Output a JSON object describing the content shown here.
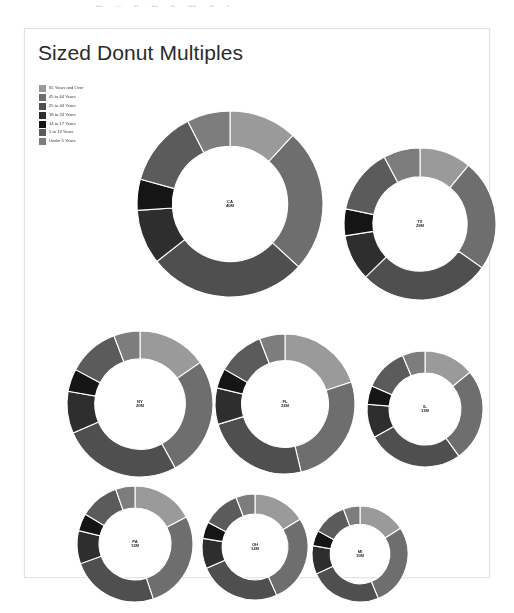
{
  "top_bar": {
    "fragments": [
      "•••",
      "—",
      "••",
      "•••",
      "••",
      "••••",
      "••",
      "•"
    ]
  },
  "panel": {
    "title": "Sized Donut Multiples"
  },
  "legend": {
    "entries": [
      {
        "label": "65 Years and Over",
        "color": "#9a9a9a"
      },
      {
        "label": "45 to 64 Years",
        "color": "#6e6e6e"
      },
      {
        "label": "25 to 44 Years",
        "color": "#4f4f4f"
      },
      {
        "label": "18 to 24 Years",
        "color": "#2e2e2e"
      },
      {
        "label": "14 to 17 Years",
        "color": "#151515"
      },
      {
        "label": "5 to 13 Years",
        "color": "#5b5b5b"
      },
      {
        "label": "Under 5 Years",
        "color": "#7d7d7d"
      }
    ]
  },
  "chart_data": {
    "type": "pie",
    "title": "Sized Donut Multiples",
    "subtype": "donut-multiples",
    "legend_position": "top-left",
    "size_encodes": "total population",
    "categories": [
      "65 Years and Over",
      "45 to 64 Years",
      "25 to 44 Years",
      "18 to 24 Years",
      "14 to 17 Years",
      "5 to 13 Years",
      "Under 5 Years"
    ],
    "colors": [
      "#9a9a9a",
      "#6e6e6e",
      "#4f4f4f",
      "#2e2e2e",
      "#151515",
      "#5b5b5b",
      "#7d7d7d"
    ],
    "donuts": [
      {
        "state": "CA",
        "value": "40M",
        "total": 40,
        "radius": 93,
        "inner_ratio": 0.62,
        "cx": 205,
        "cy": 175,
        "values": [
          11.8,
          25.0,
          27.6,
          9.5,
          5.4,
          13.2,
          7.5
        ]
      },
      {
        "state": "TX",
        "value": "29M",
        "total": 29,
        "radius": 76,
        "inner_ratio": 0.62,
        "cx": 395,
        "cy": 195,
        "values": [
          11.0,
          23.8,
          27.9,
          9.8,
          5.7,
          14.0,
          7.8
        ]
      },
      {
        "state": "NY",
        "value": "20M",
        "total": 20,
        "radius": 73,
        "inner_ratio": 0.62,
        "cx": 115,
        "cy": 375,
        "values": [
          15.4,
          26.6,
          26.5,
          9.3,
          5.0,
          11.4,
          5.8
        ]
      },
      {
        "state": "FL",
        "value": "22M",
        "total": 22,
        "radius": 70,
        "inner_ratio": 0.62,
        "cx": 260,
        "cy": 375,
        "values": [
          19.9,
          26.4,
          24.0,
          8.4,
          4.6,
          10.8,
          5.9
        ]
      },
      {
        "state": "IL",
        "value": "13M",
        "total": 13,
        "radius": 58,
        "inner_ratio": 0.62,
        "cx": 400,
        "cy": 380,
        "values": [
          14.1,
          26.0,
          26.8,
          9.4,
          5.2,
          12.2,
          6.3
        ]
      },
      {
        "state": "PA",
        "value": "13M",
        "total": 13,
        "radius": 58,
        "inner_ratio": 0.62,
        "cx": 110,
        "cy": 515,
        "values": [
          17.3,
          27.6,
          24.6,
          9.2,
          4.9,
          11.0,
          5.4
        ]
      },
      {
        "state": "OH",
        "value": "12M",
        "total": 12,
        "radius": 53,
        "inner_ratio": 0.62,
        "cx": 230,
        "cy": 518,
        "values": [
          16.2,
          27.1,
          25.1,
          9.2,
          5.1,
          11.5,
          5.8
        ]
      },
      {
        "state": "MI",
        "value": "10M",
        "total": 10,
        "radius": 48,
        "inner_ratio": 0.62,
        "cx": 335,
        "cy": 525,
        "values": [
          16.0,
          27.8,
          24.4,
          9.6,
          5.2,
          11.4,
          5.6
        ]
      }
    ]
  }
}
